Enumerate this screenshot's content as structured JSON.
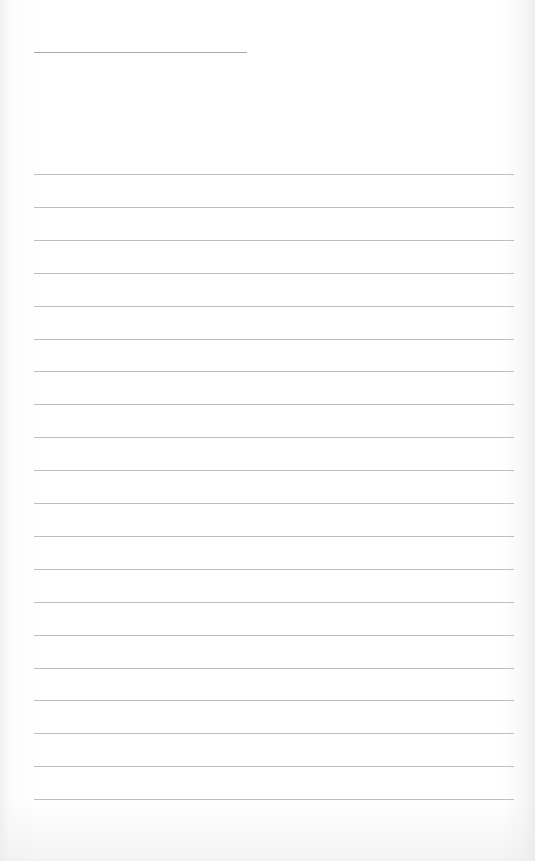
{
  "document": {
    "type": "lined-paper",
    "title_line": "",
    "lines": [
      "",
      "",
      "",
      "",
      "",
      "",
      "",
      "",
      "",
      "",
      "",
      "",
      "",
      "",
      "",
      "",
      "",
      "",
      "",
      ""
    ],
    "colors": {
      "paper": "#ffffff",
      "rule": "#b4b4b4"
    }
  }
}
